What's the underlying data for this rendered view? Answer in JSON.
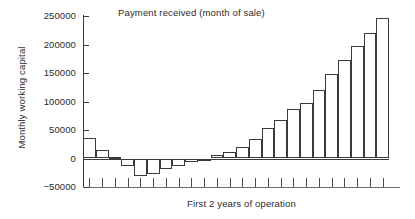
{
  "chart_data": {
    "type": "bar",
    "title": "Payment received (month of sale)",
    "xlabel": "First 2 years of operation",
    "ylabel": "Monthly working capital",
    "grid": false,
    "legend": null,
    "ylim": [
      -50000,
      250000
    ],
    "ytick_labels": [
      "250000",
      "200000",
      "150000",
      "100000",
      "50000",
      "0",
      "-50000"
    ],
    "ytick_values": [
      250000,
      200000,
      150000,
      100000,
      50000,
      0,
      -50000
    ],
    "categories": [
      "1",
      "2",
      "3",
      "4",
      "5",
      "6",
      "7",
      "8",
      "9",
      "10",
      "11",
      "12",
      "13",
      "14",
      "15",
      "16",
      "17",
      "18",
      "19",
      "20",
      "21",
      "22",
      "23",
      "24"
    ],
    "values": [
      36000,
      15000,
      2000,
      -14000,
      -31000,
      -28000,
      -18000,
      -13000,
      -7000,
      -2000,
      6000,
      11000,
      20000,
      34000,
      54000,
      68000,
      87000,
      98000,
      120000,
      148000,
      172000,
      197000,
      221000,
      246000
    ],
    "xtick_labels": []
  }
}
